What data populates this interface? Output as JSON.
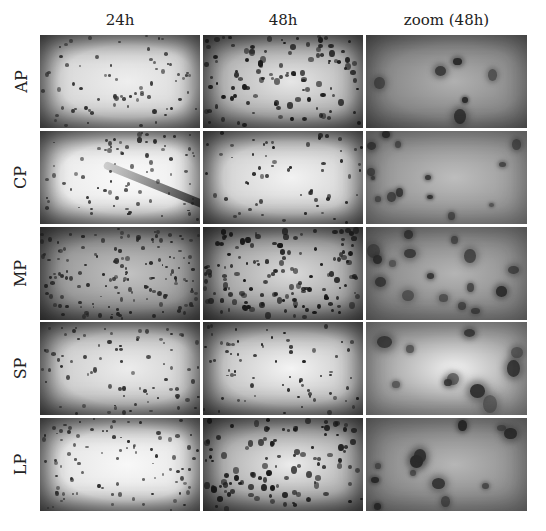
{
  "figure": {
    "columns": [
      {
        "label": "24h"
      },
      {
        "label": "48h"
      },
      {
        "label": "zoom (48h)"
      }
    ],
    "rows": [
      {
        "label": "AP"
      },
      {
        "label": "CP"
      },
      {
        "label": "MP"
      },
      {
        "label": "SP"
      },
      {
        "label": "LP"
      }
    ],
    "panels": [
      [
        {
          "desc": "AP 24h: sparse dark cells on light field, vignetted",
          "bg": "#d9d9d9",
          "center": "#eeeeee",
          "edge": "#3a3a3a",
          "density": 70,
          "size": 3,
          "dot": "#333"
        },
        {
          "desc": "AP 48h: dense clustered cells, network formation",
          "bg": "#b8b8b8",
          "center": "#e6e6e6",
          "edge": "#262626",
          "density": 110,
          "size": 4,
          "dot": "#1a1a1a"
        },
        {
          "desc": "AP zoom 48h: textured grey field with dark network nodes",
          "bg": "#8a8a8a",
          "center": "#b0b0b0",
          "edge": "#3a3a3a",
          "density": 6,
          "size": 8,
          "dot": "#2a2a2a"
        }
      ],
      [
        {
          "desc": "CP 24h: bright field with scattered cells and dark diagonal streak",
          "bg": "#ececec",
          "center": "#fafafa",
          "edge": "#3d3d3d",
          "density": 80,
          "size": 3,
          "dot": "#333",
          "streak": true
        },
        {
          "desc": "CP 48h: bright field with sparse cells",
          "bg": "#d4d4d4",
          "center": "#f2f2f2",
          "edge": "#2e2e2e",
          "density": 60,
          "size": 3,
          "dot": "#222"
        },
        {
          "desc": "CP zoom 48h: grey textured field with isolated round cells",
          "bg": "#9a9a9a",
          "center": "#bdbdbd",
          "edge": "#6a6a6a",
          "density": 14,
          "size": 6,
          "dot": "#2c2c2c"
        }
      ],
      [
        {
          "desc": "MP 24h: darker field with dense uniform cells",
          "bg": "#9c9c9c",
          "center": "#c2c2c2",
          "edge": "#262626",
          "density": 150,
          "size": 3,
          "dot": "#2a2a2a"
        },
        {
          "desc": "MP 48h: dense cells forming network",
          "bg": "#a8a8a8",
          "center": "#dadada",
          "edge": "#222",
          "density": 140,
          "size": 4,
          "dot": "#1a1a1a"
        },
        {
          "desc": "MP zoom 48h: grey field with clustered cell aggregates",
          "bg": "#8e8e8e",
          "center": "#b4b4b4",
          "edge": "#5a5a5a",
          "density": 16,
          "size": 9,
          "dot": "#2a2a2a"
        }
      ],
      [
        {
          "desc": "SP 24h: light field with scattered elongated cells",
          "bg": "#cfcfcf",
          "center": "#ececec",
          "edge": "#2e2e2e",
          "density": 80,
          "size": 3,
          "dot": "#333"
        },
        {
          "desc": "SP 48h: light field with scattered cells, bright center",
          "bg": "#c8c8c8",
          "center": "#f4f4f4",
          "edge": "#2a2a2a",
          "density": 70,
          "size": 3,
          "dot": "#222"
        },
        {
          "desc": "SP zoom 48h: bright field with branching cell clusters",
          "bg": "#a8a8a8",
          "center": "#f0f0f0",
          "edge": "#6e6e6e",
          "density": 10,
          "size": 12,
          "dot": "#333"
        }
      ],
      [
        {
          "desc": "LP 24h: bright field with scattered cells",
          "bg": "#e6e6e6",
          "center": "#f8f8f8",
          "edge": "#3a3a3a",
          "density": 90,
          "size": 3,
          "dot": "#333"
        },
        {
          "desc": "LP 48h: mid-grey field with dense cells and network",
          "bg": "#b2b2b2",
          "center": "#ececec",
          "edge": "#242424",
          "density": 110,
          "size": 4,
          "dot": "#1a1a1a"
        },
        {
          "desc": "LP zoom 48h: grey textured field with cell aggregates",
          "bg": "#8f8f8f",
          "center": "#b6b6b6",
          "edge": "#5c5c5c",
          "density": 12,
          "size": 10,
          "dot": "#2a2a2a"
        }
      ]
    ]
  },
  "layout": {
    "col_x": [
      40,
      203,
      366
    ],
    "col_w": 160,
    "row_y": [
      35,
      131,
      227,
      322,
      418
    ],
    "row_h": 93
  }
}
